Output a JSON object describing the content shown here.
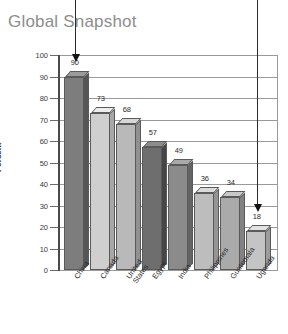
{
  "chart_data": {
    "type": "bar",
    "title": "Global Snapshot",
    "xlabel": "",
    "ylabel": "Percent",
    "ylim": [
      0,
      100
    ],
    "grid": true,
    "legend": "none",
    "categories": [
      "China",
      "Canada",
      "United\nStates",
      "Egypt",
      "India",
      "Philippines",
      "Guatemala",
      "Uganda"
    ],
    "values": [
      90,
      73,
      68,
      57,
      49,
      36,
      34,
      18
    ],
    "y_ticks": [
      100,
      90,
      80,
      70,
      60,
      50,
      40,
      30,
      20,
      10,
      0
    ],
    "bar_colors": [
      "#7d7d7d",
      "#cfcfcf",
      "#b9b9b9",
      "#6e6e6e",
      "#8b8b8b",
      "#bdbdbd",
      "#aaaaaa",
      "#c4c4c4"
    ],
    "annotations": [
      {
        "name": "arrow-to-highest-bar",
        "target_category": "China",
        "target_value": 90
      },
      {
        "name": "arrow-to-lowest-bar",
        "target_category": "Uganda",
        "target_value": 18
      }
    ]
  }
}
